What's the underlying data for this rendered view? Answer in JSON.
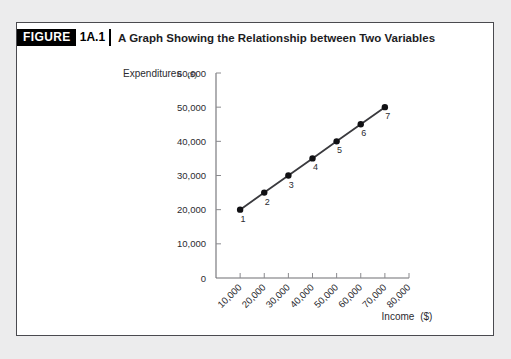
{
  "figure": {
    "badge_word": "FIGURE",
    "badge_number": "1A.1",
    "title": "A Graph Showing the Relationship between Two Variables"
  },
  "colors": {
    "page_background": "#ececed",
    "panel_background": "#ffffff",
    "panel_border": "#4a4a4f",
    "badge_background": "#000000",
    "badge_text": "#ffffff",
    "line": "#3a3a3e",
    "marker": "#111114",
    "axis": "#6e6e73"
  },
  "chart_data": {
    "type": "line",
    "title": "A Graph Showing the Relationship between Two Variables",
    "xlabel": "Income ($)",
    "ylabel": "Expenditures ($)",
    "xlabel_text": "Income",
    "xlabel_unit": "($)",
    "ylabel_text": "Expenditures",
    "ylabel_unit": "($)",
    "x": [
      10000,
      20000,
      30000,
      40000,
      50000,
      60000,
      70000
    ],
    "values": [
      20000,
      25000,
      30000,
      35000,
      40000,
      45000,
      50000
    ],
    "point_labels": [
      "1",
      "2",
      "3",
      "4",
      "5",
      "6",
      "7"
    ],
    "xlim": [
      0,
      80000
    ],
    "ylim": [
      0,
      60000
    ],
    "xticks": [
      0,
      10000,
      20000,
      30000,
      40000,
      50000,
      60000,
      70000,
      80000
    ],
    "xtick_labels": [
      "",
      "10,000",
      "20,000",
      "30,000",
      "40,000",
      "50,000",
      "60,000",
      "70,000",
      "80,000"
    ],
    "yticks": [
      0,
      10000,
      20000,
      30000,
      40000,
      50000,
      60000
    ],
    "ytick_labels": [
      "0",
      "10,000",
      "20,000",
      "30,000",
      "40,000",
      "50,000",
      "60,000"
    ],
    "grid": false,
    "legend": false,
    "xtick_label_rotation": -45,
    "marker": "circle"
  }
}
